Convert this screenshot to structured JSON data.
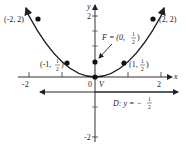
{
  "figure": {
    "type": "parabola-diagram",
    "axes": {
      "x_label": "x",
      "y_label": "y",
      "x_ticks": [
        "-2",
        "2"
      ],
      "y_ticks": [
        "2",
        "-2"
      ],
      "origin_label": "0"
    },
    "points": [
      {
        "label": "(-2, 2)",
        "x": -2,
        "y": 2
      },
      {
        "label": "(2, 2)",
        "x": 2,
        "y": 2
      },
      {
        "label_prefix": "(-1, ",
        "frac_num": "1",
        "frac_den": "2",
        "label_suffix": ")",
        "x": -1,
        "y": 0.5
      },
      {
        "label_prefix": "(1, ",
        "frac_num": "1",
        "frac_den": "2",
        "label_suffix": ")",
        "x": 1,
        "y": 0.5
      }
    ],
    "vertex_label": "V",
    "focus": {
      "prefix": "F = (0, ",
      "frac_num": "1",
      "frac_den": "2",
      "suffix": ")"
    },
    "directrix": {
      "prefix": "D: y = −",
      "frac_num": "1",
      "frac_den": "2"
    },
    "colors": {
      "curve": "#1a1a1a",
      "axes": "#333333",
      "text": "#222222"
    }
  }
}
